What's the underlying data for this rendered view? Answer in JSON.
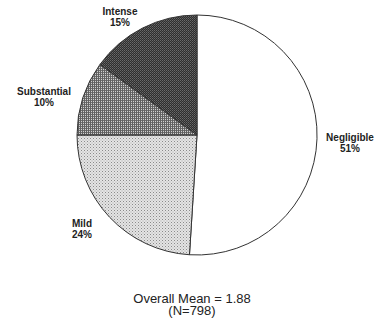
{
  "chart_data": {
    "type": "pie",
    "title": "",
    "start_angle_deg": 0,
    "direction": "clockwise",
    "slices": [
      {
        "label": "Negligible",
        "value": 51,
        "display": "51%",
        "fill": "#ffffff",
        "pattern": "none"
      },
      {
        "label": "Mild",
        "value": 24,
        "display": "24%",
        "fill": "#d6d6d6",
        "pattern": "fine-stipple"
      },
      {
        "label": "Substantial",
        "value": 10,
        "display": "10%",
        "fill": "#9a9a9a",
        "pattern": "crosshatch"
      },
      {
        "label": "Intense",
        "value": 15,
        "display": "15%",
        "fill": "#4a4a4a",
        "pattern": "dense-dark"
      }
    ],
    "annotations": [
      "Overall Mean = 1.88",
      "(N=798)"
    ]
  },
  "labels": {
    "negligible": {
      "name": "Negligible",
      "pct": "51%"
    },
    "mild": {
      "name": "Mild",
      "pct": "24%"
    },
    "substantial": {
      "name": "Substantial",
      "pct": "10%"
    },
    "intense": {
      "name": "Intense",
      "pct": "15%"
    }
  },
  "caption": {
    "mean": "Overall Mean = 1.88",
    "n": "(N=798)"
  }
}
